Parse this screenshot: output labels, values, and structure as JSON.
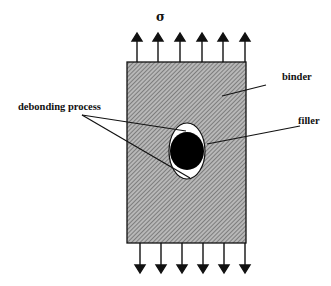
{
  "diagram": {
    "stress_symbol": "σ",
    "labels": {
      "binder": "binder",
      "filler": "filler",
      "debonding": "debonding process"
    },
    "colors": {
      "ink": "#111111",
      "hatch_bg": "#b8b8b8",
      "hatch_line": "#555555",
      "void": "#ffffff",
      "particle": "#000000"
    },
    "top_arrows_count": 6,
    "bottom_arrows_count": 6
  }
}
